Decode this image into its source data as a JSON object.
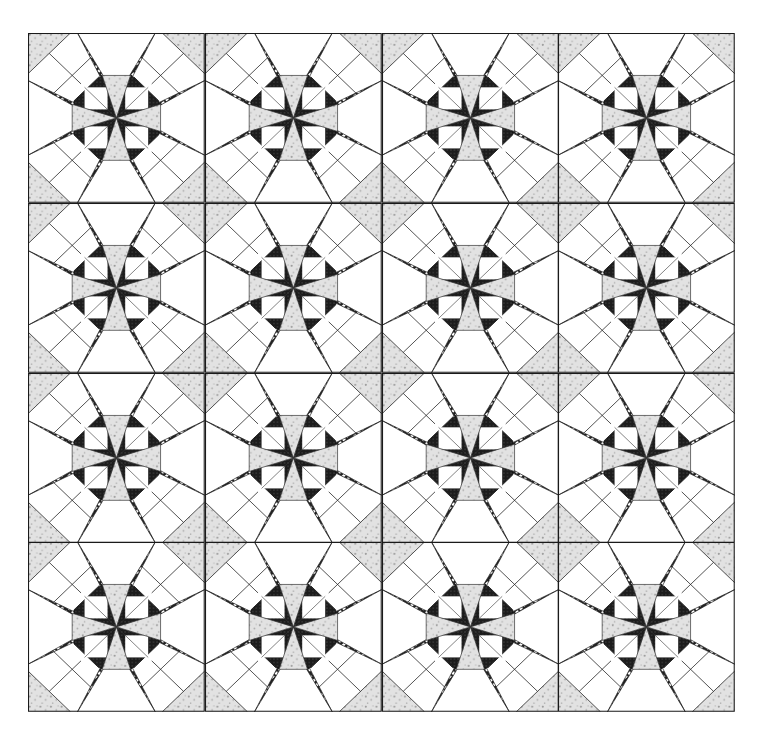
{
  "figure": {
    "title": ""
  },
  "grid": {
    "rows": 4,
    "cols": 4
  },
  "colors": {
    "background": "#ffffff",
    "outline": "#1a1a1a",
    "dark_hatch": "#2a2a2a",
    "dark_fill": "#222222",
    "light_texture": "#d8d8d8",
    "white": "#ffffff"
  }
}
